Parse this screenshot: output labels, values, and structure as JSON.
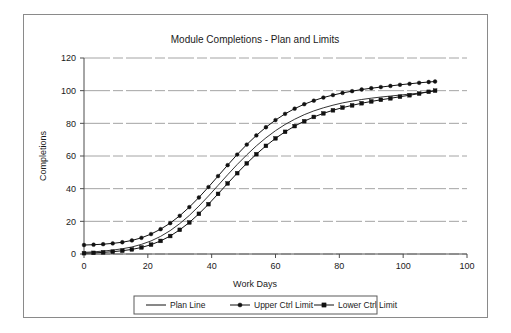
{
  "chart_data": {
    "type": "line",
    "title": "Module Completions - Plan and Limits",
    "xlabel": "Work Days",
    "ylabel": "Completions",
    "xlim": [
      0,
      120
    ],
    "ylim": [
      0,
      120
    ],
    "grid": true,
    "legend_position": "bottom",
    "x_ticks": [
      "0",
      "20",
      "40",
      "60",
      "80",
      "100",
      "100"
    ],
    "x_tick_values": [
      0,
      20,
      40,
      60,
      80,
      100,
      120
    ],
    "y_ticks": [
      "0",
      "20",
      "40",
      "60",
      "80",
      "100",
      "120"
    ],
    "y_tick_values": [
      0,
      20,
      40,
      60,
      80,
      100,
      120
    ],
    "x": [
      0,
      3,
      6,
      9,
      12,
      15,
      18,
      21,
      24,
      27,
      30,
      33,
      36,
      39,
      42,
      45,
      48,
      51,
      54,
      57,
      60,
      63,
      66,
      69,
      72,
      75,
      78,
      81,
      84,
      87,
      90,
      93,
      96,
      99,
      102,
      105,
      108,
      110
    ],
    "series": [
      {
        "name": "Plan Line",
        "marker": "none",
        "values": [
          1.0,
          1.3,
          1.8,
          2.4,
          3.2,
          4.3,
          5.9,
          8.0,
          10.8,
          14.3,
          18.6,
          23.6,
          29.3,
          35.5,
          42.0,
          48.5,
          54.8,
          60.7,
          66.2,
          71.1,
          75.5,
          79.3,
          82.5,
          85.3,
          87.6,
          89.5,
          91.1,
          92.5,
          93.6,
          94.6,
          95.4,
          96.1,
          96.7,
          97.3,
          97.9,
          98.5,
          99.3,
          100.0
        ]
      },
      {
        "name": "Upper Ctrl Limit",
        "marker": "circle",
        "values": [
          5.5,
          5.7,
          6.0,
          6.5,
          7.2,
          8.3,
          9.9,
          12.2,
          15.2,
          18.9,
          23.4,
          28.7,
          34.6,
          41.0,
          47.7,
          54.4,
          60.9,
          67.0,
          72.6,
          77.6,
          82.0,
          85.8,
          89.0,
          91.7,
          93.9,
          95.8,
          97.3,
          98.6,
          99.7,
          100.7,
          101.5,
          102.2,
          102.9,
          103.6,
          104.2,
          104.8,
          105.3,
          105.6
        ]
      },
      {
        "name": "Lower Ctrl Limit",
        "marker": "square",
        "values": [
          0.5,
          0.7,
          1.0,
          1.4,
          2.0,
          2.8,
          4.0,
          5.7,
          8.0,
          11.0,
          14.8,
          19.3,
          24.6,
          30.5,
          36.8,
          43.2,
          49.5,
          55.5,
          61.1,
          66.2,
          70.8,
          74.8,
          78.3,
          81.3,
          83.9,
          86.1,
          88.0,
          89.6,
          91.0,
          92.3,
          93.4,
          94.4,
          95.3,
          96.3,
          97.2,
          98.2,
          99.3,
          100.0
        ]
      }
    ],
    "colors": {
      "plan_line": "#111111",
      "upper_ctrl_limit": "#111111",
      "lower_ctrl_limit": "#111111",
      "gridline": "#9a9a9a",
      "axis": "#4d4d4d",
      "frame": "#8a8a8a",
      "text": "#1a1a1a"
    }
  }
}
